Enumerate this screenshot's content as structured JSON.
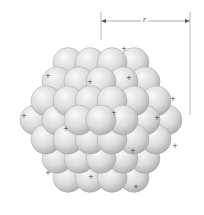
{
  "diagram": {
    "radius_label": "r",
    "proton_marker": "+",
    "colors": {
      "sphere_light": "#f4f4f4",
      "sphere_mid": "#d2d2d2",
      "sphere_dark": "#a8a8a8",
      "outline": "#9a9a9a",
      "marker": "#444444",
      "dimension_line": "#777777"
    },
    "nucleus": {
      "cx": 101,
      "cy": 120,
      "radius": 88
    },
    "dimension": {
      "x_start": 101,
      "x_end": 190,
      "y": 21,
      "label_x": 145
    },
    "protons": [
      [
        124,
        48
      ],
      [
        48,
        75
      ],
      [
        90,
        81
      ],
      [
        129,
        77
      ],
      [
        173,
        98
      ],
      [
        24,
        115
      ],
      [
        114,
        112
      ],
      [
        157,
        117
      ],
      [
        66,
        128
      ],
      [
        175,
        145
      ],
      [
        133,
        150
      ],
      [
        48,
        172
      ],
      [
        91,
        176
      ],
      [
        136,
        186
      ]
    ]
  }
}
